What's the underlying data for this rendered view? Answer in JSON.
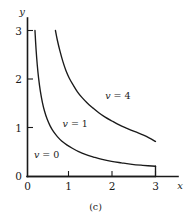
{
  "figure": {
    "caption": "(c)",
    "background_color": "#ffffff",
    "ink_color": "#1a1a1a"
  },
  "chart_data": {
    "type": "line",
    "title": "",
    "subtitle": "",
    "xlabel": "x",
    "ylabel": "y",
    "xlim": [
      0,
      3.5
    ],
    "ylim": [
      0,
      3.2
    ],
    "xticks": [
      0,
      1,
      2,
      3
    ],
    "xtick_labels": [
      "0",
      "1",
      "2",
      "3"
    ],
    "yticks": [
      0,
      1,
      2,
      3
    ],
    "ytick_labels": [
      "0",
      "1",
      "2",
      "3"
    ],
    "grid": false,
    "legend": "inline-annotations",
    "annotations": [
      {
        "text": "v = 0",
        "var": "v",
        "rest": " = 0",
        "x": 0.15,
        "y": 0.38
      },
      {
        "text": "v = 1",
        "var": "v",
        "rest": " = 1",
        "x": 0.82,
        "y": 1.02
      },
      {
        "text": "v = 4",
        "var": "v",
        "rest": " = 4",
        "x": 1.82,
        "y": 1.6
      }
    ],
    "series": [
      {
        "name": "v = 0",
        "label": "v = 0",
        "values": [
          [
            0.0,
            0.0
          ],
          [
            3.0,
            0.0
          ]
        ]
      },
      {
        "name": "v = 1",
        "label": "v = 1",
        "values": [
          [
            0.175,
            3.0
          ],
          [
            0.2,
            2.62
          ],
          [
            0.23,
            2.28
          ],
          [
            0.26,
            2.02
          ],
          [
            0.3,
            1.76
          ],
          [
            0.35,
            1.52
          ],
          [
            0.4,
            1.34
          ],
          [
            0.46,
            1.18
          ],
          [
            0.53,
            1.04
          ],
          [
            0.61,
            0.92
          ],
          [
            0.7,
            0.82
          ],
          [
            0.8,
            0.73
          ],
          [
            0.92,
            0.65
          ],
          [
            1.05,
            0.58
          ],
          [
            1.2,
            0.51
          ],
          [
            1.37,
            0.45
          ],
          [
            1.55,
            0.4
          ],
          [
            1.75,
            0.35
          ],
          [
            1.97,
            0.31
          ],
          [
            2.2,
            0.28
          ],
          [
            2.45,
            0.25
          ],
          [
            2.7,
            0.23
          ],
          [
            3.0,
            0.21
          ]
        ]
      },
      {
        "name": "v = 4",
        "label": "v = 4",
        "values": [
          [
            0.655,
            3.0
          ],
          [
            0.7,
            2.8
          ],
          [
            0.76,
            2.58
          ],
          [
            0.83,
            2.36
          ],
          [
            0.9,
            2.18
          ],
          [
            0.98,
            2.02
          ],
          [
            1.07,
            1.88
          ],
          [
            1.17,
            1.74
          ],
          [
            1.28,
            1.62
          ],
          [
            1.4,
            1.51
          ],
          [
            1.53,
            1.41
          ],
          [
            1.67,
            1.31
          ],
          [
            1.82,
            1.22
          ],
          [
            1.98,
            1.14
          ],
          [
            2.15,
            1.06
          ],
          [
            2.33,
            0.99
          ],
          [
            2.52,
            0.92
          ],
          [
            2.72,
            0.85
          ],
          [
            2.86,
            0.79
          ],
          [
            3.0,
            0.72
          ]
        ]
      }
    ],
    "baseline_segment": {
      "name": "v = 0 baseline",
      "from": [
        0.0,
        0.0
      ],
      "to": [
        3.0,
        0.0
      ]
    },
    "right_end_caps": [
      {
        "series": "v = 1",
        "x": 3.0,
        "y_from": 0.21,
        "y_to": 0.0
      }
    ]
  }
}
